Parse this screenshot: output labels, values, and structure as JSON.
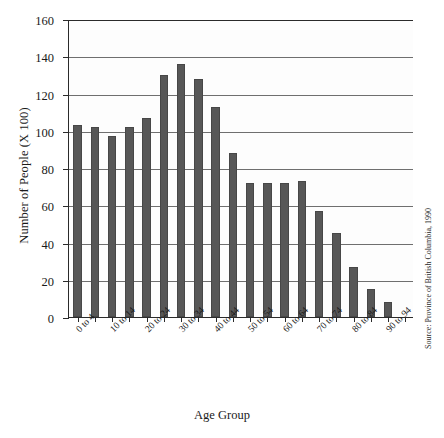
{
  "chart_data": {
    "type": "bar",
    "title": "",
    "xlabel": "Age Group",
    "ylabel": "Number of People (X 100)",
    "categories": [
      "0 to 4",
      "5 to 9",
      "10 to 14",
      "15 to 19",
      "20 to 24",
      "25 to 29",
      "30 to 34",
      "35 to 39",
      "40 to 44",
      "45 to 49",
      "50 to 54",
      "55 to 59",
      "60 to 64",
      "65 to 69",
      "70 to 74",
      "75 to 79",
      "80 to 84",
      "85 to 89",
      "90 to 94",
      "95+"
    ],
    "values": [
      103,
      102,
      97,
      102,
      107,
      130,
      136,
      128,
      113,
      88,
      72,
      72,
      72,
      73,
      57,
      45,
      27,
      15,
      8,
      0
    ],
    "ylim": [
      0,
      160
    ],
    "ytick_labels": [
      "0",
      "20",
      "40",
      "60",
      "80",
      "100",
      "120",
      "140",
      "160"
    ],
    "ytick_values": [
      0,
      20,
      40,
      60,
      80,
      100,
      120,
      140,
      160
    ],
    "visible_xtick_labels": [
      "0 to 4",
      "10 to 14",
      "20 to 24",
      "30 to 34",
      "40 to 44",
      "50 to 54",
      "60 to 64",
      "70 to 74",
      "80 to 84",
      "90 to 94"
    ],
    "grid": true,
    "legend": "none",
    "bar_color": "#575757",
    "axis_color": "#2b2b2b",
    "gridline_color": "#6f6f6f",
    "source_note": "Source: Province of British Columbia, 1990"
  }
}
